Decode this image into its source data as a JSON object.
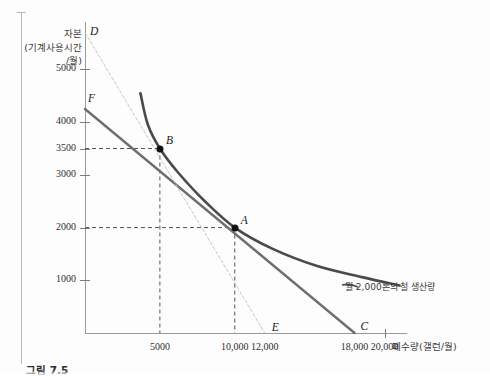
{
  "figure": {
    "caption": "그림 7.5",
    "annotation": "월 2,000톤의 철 생산량"
  },
  "axes": {
    "y_title": "자본\n(기계사용시간\n/월)",
    "x_title": "폐수량(갤런/월)",
    "y_ticks": [
      {
        "value": 5000,
        "label": "5000"
      },
      {
        "value": 4000,
        "label": "4000"
      },
      {
        "value": 3500,
        "label": "3500"
      },
      {
        "value": 3000,
        "label": "3000"
      },
      {
        "value": 2000,
        "label": "2000"
      },
      {
        "value": 1000,
        "label": "1000"
      }
    ],
    "x_ticks": [
      {
        "value": 5000,
        "label": "5000"
      },
      {
        "value": 10000,
        "label": "10,000"
      },
      {
        "value": 12000,
        "label": "12,000"
      },
      {
        "value": 18000,
        "label": "18,000"
      },
      {
        "value": 20000,
        "label": "20,000"
      }
    ]
  },
  "labels": {
    "D": "D",
    "E": "E",
    "F": "F",
    "C": "C",
    "A": "A",
    "B": "B"
  },
  "colors": {
    "isoquant": "#4a4a4a",
    "isocost_fc": "#6f6f6f",
    "isocost_de": "#c2c2c2",
    "guide": "#555555",
    "axis": "#9a9a9a",
    "point": "#111111"
  },
  "chart_data": {
    "type": "line",
    "title": "월 2,000톤의 철 생산량",
    "xlabel": "폐수량(갤런/월)",
    "ylabel": "자본(기계사용시간/월)",
    "xlim": [
      0,
      21500
    ],
    "ylim": [
      0,
      5900
    ],
    "grid": false,
    "legend": null,
    "series": [
      {
        "name": "isoquant",
        "style": "curve",
        "color": "#4a4a4a",
        "points": [
          [
            3700,
            4550
          ],
          [
            4200,
            3950
          ],
          [
            5000,
            3500
          ],
          [
            6200,
            3050
          ],
          [
            8000,
            2500
          ],
          [
            10000,
            2000
          ],
          [
            12500,
            1600
          ],
          [
            15500,
            1270
          ],
          [
            18500,
            1060
          ],
          [
            21000,
            900
          ]
        ]
      },
      {
        "name": "isocost-FC",
        "style": "straight",
        "color": "#6f6f6f",
        "points": [
          [
            0,
            4250
          ],
          [
            18000,
            0
          ]
        ]
      },
      {
        "name": "isocost-DE",
        "style": "straight-dashed",
        "color": "#c2c2c2",
        "points": [
          [
            0,
            5700
          ],
          [
            12000,
            0
          ]
        ]
      }
    ],
    "points": [
      {
        "label": "A",
        "x": 10000,
        "y": 2000
      },
      {
        "label": "B",
        "x": 5000,
        "y": 3500
      },
      {
        "label": "D",
        "x": 0,
        "y": 5700
      },
      {
        "label": "E",
        "x": 12000,
        "y": 0
      },
      {
        "label": "F",
        "x": 0,
        "y": 4250
      },
      {
        "label": "C",
        "x": 18000,
        "y": 0
      }
    ],
    "guides": [
      {
        "from": [
          0,
          3500
        ],
        "to": [
          5000,
          3500
        ]
      },
      {
        "from": [
          5000,
          3500
        ],
        "to": [
          5000,
          0
        ]
      },
      {
        "from": [
          0,
          2000
        ],
        "to": [
          10000,
          2000
        ]
      },
      {
        "from": [
          10000,
          2000
        ],
        "to": [
          10000,
          0
        ]
      }
    ],
    "annotations": [
      {
        "text": "월 2,000톤의 철 생산량",
        "x": 19500,
        "y": 1150
      }
    ]
  }
}
